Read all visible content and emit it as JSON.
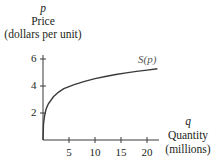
{
  "chart_data": {
    "type": "line",
    "title": "",
    "xlabel_var": "q",
    "xlabel": "Quantity",
    "xlabel_unit": "(millions)",
    "ylabel_var": "p",
    "ylabel": "Price",
    "ylabel_unit": "(dollars per unit)",
    "x_ticks": [
      5,
      10,
      15,
      20
    ],
    "y_ticks": [
      2,
      4,
      6
    ],
    "xlim": [
      0,
      22
    ],
    "ylim": [
      0,
      6.5
    ],
    "grid": false,
    "legend": "none",
    "series": [
      {
        "name": "S(p)",
        "label": "S(p)",
        "color": "#3a3a3a",
        "x": [
          0,
          0.1,
          0.3,
          0.6,
          1,
          2,
          3,
          4,
          5,
          6,
          8,
          10,
          12,
          14,
          16,
          18,
          20,
          22
        ],
        "y": [
          0,
          1.2,
          1.8,
          2.3,
          2.65,
          3.2,
          3.55,
          3.8,
          3.95,
          4.1,
          4.35,
          4.55,
          4.7,
          4.85,
          4.97,
          5.08,
          5.18,
          5.28
        ]
      }
    ]
  },
  "labels": {
    "p": "p",
    "price": "Price",
    "price_unit": "(dollars per unit)",
    "q": "q",
    "quantity": "Quantity",
    "quantity_unit": "(millions)",
    "curve": "S(p)",
    "xt": [
      "5",
      "10",
      "15",
      "20"
    ],
    "yt": [
      "2",
      "4",
      "6"
    ]
  }
}
